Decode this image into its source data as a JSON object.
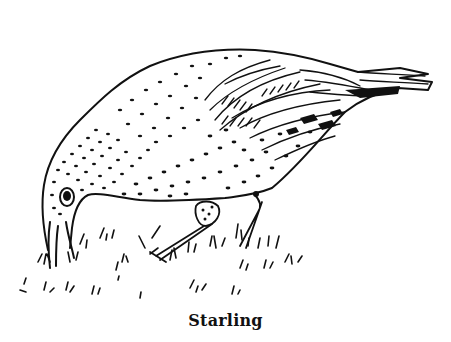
{
  "figure": {
    "style": "black-and-white pen line drawing",
    "pose": "bird bending down, beak to ground, foraging in grass",
    "caption": "Starling",
    "colors": {
      "ink": "#111111",
      "paper": "#ffffff"
    }
  }
}
